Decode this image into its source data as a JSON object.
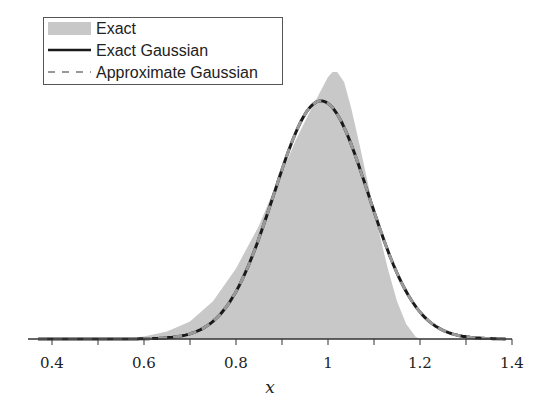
{
  "chart_data": {
    "type": "area",
    "title": "",
    "xlabel": "x",
    "ylabel": "",
    "xlim": [
      0.35,
      1.4
    ],
    "ylim": [
      0,
      1.15
    ],
    "grid": false,
    "legend_position": "upper left",
    "x_ticks": [
      0.4,
      0.5,
      0.6,
      0.7,
      0.8,
      0.9,
      1.0,
      1.1,
      1.2,
      1.3,
      1.4
    ],
    "x_tick_labels": [
      "0.4",
      "",
      "0.6",
      "",
      "0.8",
      "",
      "1",
      "",
      "1.2",
      "",
      "1.4"
    ],
    "series": [
      {
        "name": "Exact",
        "style": "filled-area",
        "color": "#c8c8c8",
        "x": [
          0.35,
          0.55,
          0.6,
          0.65,
          0.7,
          0.75,
          0.8,
          0.85,
          0.88,
          0.9,
          0.93,
          0.96,
          0.98,
          1.0,
          1.01,
          1.02,
          1.035,
          1.05,
          1.07,
          1.09,
          1.11,
          1.13,
          1.15,
          1.17,
          1.19,
          1.2,
          1.4
        ],
        "values": [
          0.0,
          0.0,
          0.01,
          0.03,
          0.07,
          0.15,
          0.28,
          0.45,
          0.58,
          0.66,
          0.79,
          0.9,
          0.97,
          1.04,
          1.06,
          1.06,
          1.02,
          0.92,
          0.76,
          0.59,
          0.43,
          0.28,
          0.15,
          0.06,
          0.01,
          0.0,
          0.0
        ]
      },
      {
        "name": "Exact Gaussian",
        "style": "solid",
        "color": "#1a1a1a",
        "mean": 0.985,
        "std": 0.103,
        "peak": 0.945
      },
      {
        "name": "Approximate Gaussian",
        "style": "dashed",
        "color": "#999999",
        "mean": 0.985,
        "std": 0.103,
        "peak": 0.945
      }
    ]
  },
  "legend": {
    "items": [
      {
        "label": "Exact",
        "swatch": "area"
      },
      {
        "label": "Exact Gaussian",
        "swatch": "solid"
      },
      {
        "label": "Approximate Gaussian",
        "swatch": "dashed"
      }
    ]
  },
  "axis": {
    "xlabel": "x",
    "tick_labels": [
      "0.4",
      "0.6",
      "0.8",
      "1",
      "1.2",
      "1.4"
    ]
  }
}
